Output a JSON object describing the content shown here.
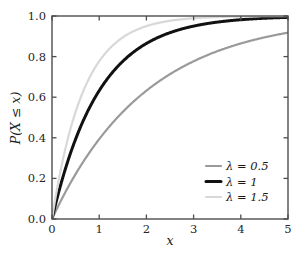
{
  "chart_data": {
    "type": "line",
    "title": "",
    "subtitle": "",
    "xlabel": "x",
    "ylabel": "P(X ≤ x)",
    "xlim": [
      0,
      5
    ],
    "ylim": [
      0,
      1
    ],
    "grid": false,
    "legend_position": "lower right",
    "xticks": [
      "0",
      "1",
      "2",
      "3",
      "4",
      "5"
    ],
    "xtick_values": [
      0,
      1,
      2,
      3,
      4,
      5
    ],
    "yticks": [
      "0.0",
      "0.2",
      "0.4",
      "0.6",
      "0.8",
      "1.0"
    ],
    "ytick_values": [
      0.0,
      0.2,
      0.4,
      0.6,
      0.8,
      1.0
    ],
    "function": "P(X ≤ x) = 1 - exp(-lambda*x)",
    "x": [
      0,
      0.25,
      0.5,
      0.75,
      1,
      1.25,
      1.5,
      1.75,
      2,
      2.25,
      2.5,
      2.75,
      3,
      3.25,
      3.5,
      3.75,
      4,
      4.25,
      4.5,
      4.75,
      5
    ],
    "series": [
      {
        "name": "λ = 0.5",
        "lambda": 0.5,
        "color": "#9a9a9a",
        "width": 2.2,
        "values": [
          0.0,
          0.118,
          0.221,
          0.312,
          0.393,
          0.465,
          0.528,
          0.583,
          0.632,
          0.675,
          0.713,
          0.747,
          0.777,
          0.803,
          0.826,
          0.847,
          0.865,
          0.881,
          0.895,
          0.907,
          0.918
        ]
      },
      {
        "name": "λ = 1",
        "lambda": 1,
        "color": "#111111",
        "width": 3.0,
        "values": [
          0.0,
          0.221,
          0.393,
          0.528,
          0.632,
          0.713,
          0.777,
          0.826,
          0.865,
          0.895,
          0.918,
          0.936,
          0.95,
          0.961,
          0.97,
          0.976,
          0.982,
          0.986,
          0.989,
          0.991,
          0.993
        ]
      },
      {
        "name": "λ = 1.5",
        "lambda": 1.5,
        "color": "#d8d8d8",
        "width": 2.2,
        "values": [
          0.0,
          0.313,
          0.528,
          0.675,
          0.777,
          0.847,
          0.895,
          0.928,
          0.95,
          0.966,
          0.976,
          0.984,
          0.989,
          0.993,
          0.995,
          0.996,
          0.998,
          0.998,
          0.999,
          0.999,
          0.999
        ]
      }
    ]
  },
  "axes": {
    "x_label": "x",
    "y_label_parts": {
      "p": "P(X",
      "le": "≤",
      "x": "x)"
    },
    "y_label_full": "P(X ≤ x)"
  },
  "legend": {
    "entries": [
      {
        "label": "λ = 0.5",
        "color": "#9a9a9a",
        "width": 2.2
      },
      {
        "label": "λ = 1",
        "color": "#111111",
        "width": 3.0
      },
      {
        "label": "λ = 1.5",
        "color": "#d8d8d8",
        "width": 2.2
      }
    ]
  },
  "style": {
    "background": "#ffffff",
    "spine_color": "#4d4d4d",
    "tick_color": "#4d4d4d",
    "text_color": "#1a1a1a"
  }
}
